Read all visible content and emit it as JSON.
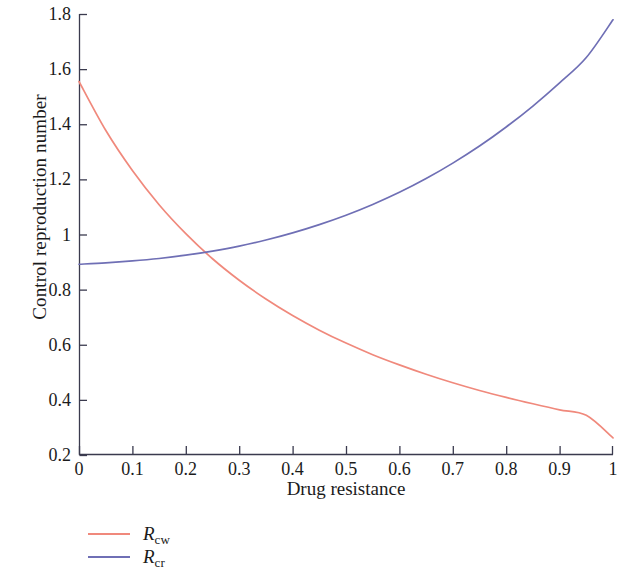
{
  "chart_data": {
    "type": "line",
    "title": "",
    "xlabel": "Drug resistance",
    "ylabel": "Control reproduction number",
    "xlim": [
      0,
      1
    ],
    "ylim": [
      0.2,
      1.8
    ],
    "grid": false,
    "legend_position": "below-left",
    "xticks": [
      "0",
      "0.1",
      "0.2",
      "0.3",
      "0.4",
      "0.5",
      "0.6",
      "0.7",
      "0.8",
      "0.9",
      "1"
    ],
    "xtick_values": [
      0,
      0.1,
      0.2,
      0.3,
      0.4,
      0.5,
      0.6,
      0.7,
      0.8,
      0.9,
      1
    ],
    "yticks": [
      "1.8",
      "1.6",
      "1.4",
      "1.2",
      "1",
      "0.8",
      "0.6",
      "0.4",
      "0.2"
    ],
    "ytick_values": [
      1.8,
      1.6,
      1.4,
      1.2,
      1.0,
      0.8,
      0.6,
      0.4,
      0.2
    ],
    "x": [
      0,
      0.05,
      0.1,
      0.15,
      0.2,
      0.25,
      0.3,
      0.35,
      0.4,
      0.45,
      0.5,
      0.55,
      0.6,
      0.65,
      0.7,
      0.75,
      0.8,
      0.85,
      0.9,
      0.95,
      1
    ],
    "series": [
      {
        "name": "R_cw",
        "label": "R",
        "sublabel": "cw",
        "color": "#f0897c",
        "values": [
          1.555,
          1.378,
          1.232,
          1.108,
          1.003,
          0.912,
          0.834,
          0.766,
          0.706,
          0.653,
          0.606,
          0.564,
          0.527,
          0.493,
          0.462,
          0.434,
          0.409,
          0.386,
          0.364,
          0.344,
          0.262
        ]
      },
      {
        "name": "R_cr",
        "label": "R",
        "sublabel": "cr",
        "color": "#6f6fb5",
        "values": [
          0.892,
          0.897,
          0.904,
          0.913,
          0.925,
          0.94,
          0.958,
          0.98,
          1.006,
          1.036,
          1.07,
          1.109,
          1.153,
          1.203,
          1.259,
          1.321,
          1.39,
          1.466,
          1.55,
          1.642,
          1.779
        ]
      }
    ],
    "annotations": [
      {
        "text": "curves intersect",
        "x": 0.15,
        "y": 0.913
      }
    ],
    "axis_color": "#3a3a4e",
    "background": "#ffffff"
  },
  "legend": {
    "items": [
      {
        "label": "R",
        "sublabel": "cw",
        "color": "#f0897c"
      },
      {
        "label": "R",
        "sublabel": "cr",
        "color": "#6f6fb5"
      }
    ]
  }
}
